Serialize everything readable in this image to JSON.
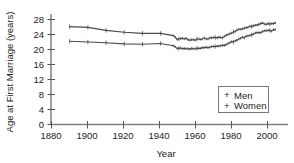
{
  "chart_data": {
    "type": "line",
    "title": "",
    "xlabel": "Year",
    "ylabel": "Age at First Marriage (years)",
    "xlim": [
      1880,
      2010
    ],
    "ylim": [
      0,
      29
    ],
    "xticks": [
      1880,
      1900,
      1920,
      1940,
      1960,
      1980,
      2000
    ],
    "xtick_labels": [
      "1880",
      "1900",
      "1920",
      "1940",
      "1960",
      "1980",
      "2000"
    ],
    "yticks": [
      0,
      4,
      8,
      12,
      16,
      20,
      24,
      28
    ],
    "ytick_labels": [
      "0",
      "4",
      "8",
      "12",
      "16",
      "20",
      "24",
      "28"
    ],
    "grid": false,
    "legend_position": "lower-right",
    "marker": "plus",
    "line_color": "#4a4a4a",
    "x": [
      1890,
      1900,
      1910,
      1920,
      1930,
      1940,
      1947,
      1948,
      1949,
      1950,
      1951,
      1952,
      1953,
      1954,
      1955,
      1956,
      1957,
      1958,
      1959,
      1960,
      1961,
      1962,
      1963,
      1964,
      1965,
      1966,
      1967,
      1968,
      1969,
      1970,
      1971,
      1972,
      1973,
      1974,
      1975,
      1976,
      1977,
      1978,
      1979,
      1980,
      1981,
      1982,
      1983,
      1984,
      1985,
      1986,
      1987,
      1988,
      1989,
      1990,
      1991,
      1992,
      1993,
      1994,
      1995,
      1996,
      1997,
      1998,
      1999,
      2000,
      2001,
      2002,
      2003
    ],
    "series": [
      {
        "name": "Men",
        "values": [
          26.1,
          25.9,
          25.1,
          24.6,
          24.3,
          24.3,
          23.7,
          23.3,
          22.7,
          22.8,
          22.9,
          23.0,
          22.8,
          23.0,
          22.6,
          22.5,
          22.6,
          22.6,
          22.5,
          22.8,
          22.8,
          22.7,
          22.8,
          23.1,
          22.8,
          22.8,
          23.1,
          23.1,
          23.2,
          23.2,
          23.1,
          23.3,
          23.2,
          23.1,
          23.5,
          23.8,
          24.0,
          24.2,
          24.4,
          24.7,
          24.8,
          25.2,
          25.4,
          25.4,
          25.5,
          25.7,
          25.8,
          25.9,
          26.2,
          26.1,
          26.3,
          26.5,
          26.5,
          26.7,
          26.9,
          27.1,
          26.8,
          26.7,
          26.9,
          26.8,
          26.9,
          26.9,
          27.1
        ]
      },
      {
        "name": "Women",
        "values": [
          22.2,
          22.0,
          21.8,
          21.5,
          21.4,
          21.6,
          21.0,
          20.7,
          20.3,
          20.3,
          20.4,
          20.2,
          20.3,
          20.2,
          20.2,
          20.1,
          20.3,
          20.2,
          20.2,
          20.3,
          20.3,
          20.3,
          20.5,
          20.5,
          20.6,
          20.5,
          20.6,
          20.8,
          20.8,
          20.8,
          20.9,
          20.9,
          21.0,
          21.1,
          21.1,
          21.3,
          21.6,
          21.8,
          22.1,
          22.0,
          22.3,
          22.5,
          22.8,
          23.0,
          23.3,
          23.1,
          23.6,
          23.6,
          23.8,
          23.9,
          24.1,
          24.4,
          24.5,
          24.5,
          24.5,
          24.8,
          25.0,
          25.0,
          25.1,
          25.1,
          24.9,
          25.3,
          25.3
        ]
      }
    ],
    "legend_entries": [
      "Men",
      "Women"
    ],
    "legend_marker_glyph": "+"
  },
  "axes": {
    "y_title": "Age at First Marriage (years)",
    "x_title": "Year"
  },
  "legend": {
    "items": [
      {
        "label": "Men",
        "marker": "+"
      },
      {
        "label": "Women",
        "marker": "+"
      }
    ]
  },
  "colors": {
    "line": "#4a4a4a",
    "axis": "#555555",
    "text": "#1c1c1c",
    "legend_border": "#777777",
    "background": "#ffffff"
  }
}
